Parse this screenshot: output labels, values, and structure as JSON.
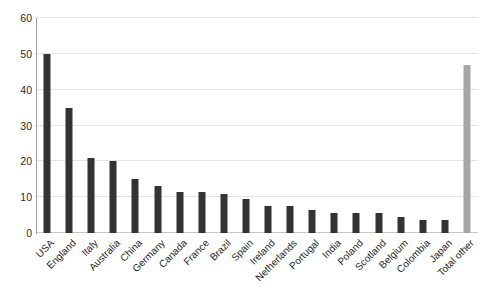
{
  "chart_data": {
    "type": "bar",
    "title": "",
    "subtitle": "",
    "xlabel": "",
    "ylabel": "",
    "ylim": [
      0,
      60
    ],
    "ytick_step": 10,
    "yticks": [
      0,
      10,
      20,
      30,
      40,
      50,
      60
    ],
    "ytick_labels": [
      "0",
      "10",
      "20",
      "30",
      "40",
      "50",
      "60"
    ],
    "grid": true,
    "grid_axis": "y",
    "legend": false,
    "legend_position": "none",
    "x_label_rotation": -45,
    "categories": [
      "USA",
      "England",
      "Italy",
      "Australia",
      "China",
      "Germany",
      "Canada",
      "France",
      "Brazil",
      "Spain",
      "Ireland",
      "Netherlands",
      "Portugal",
      "India",
      "Poland",
      "Scotland",
      "Belgium",
      "Colombia",
      "Japan",
      "Total other"
    ],
    "values": [
      50,
      35,
      21,
      20,
      15,
      13,
      11.5,
      11.5,
      11,
      9.5,
      7.5,
      7.5,
      6.5,
      5.5,
      5.5,
      5.5,
      4.5,
      3.5,
      3.5,
      47
    ],
    "bar_colors": [
      "#333333",
      "#333333",
      "#333333",
      "#333333",
      "#333333",
      "#333333",
      "#333333",
      "#333333",
      "#333333",
      "#333333",
      "#333333",
      "#333333",
      "#333333",
      "#333333",
      "#333333",
      "#333333",
      "#333333",
      "#333333",
      "#333333",
      "#a6a6a6"
    ],
    "colors": {
      "bar_primary": "#333333",
      "bar_highlight": "#a6a6a6",
      "gridline": "#e4e4e4",
      "axis": "#9d9d9d",
      "text": "#1f1f1f",
      "background": "#ffffff"
    }
  }
}
